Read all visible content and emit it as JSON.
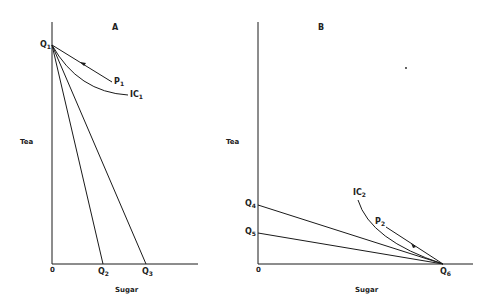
{
  "panels": [
    {
      "id": "A",
      "title": "A",
      "y_axis_label": "Tea",
      "x_axis_label": "Sugar",
      "origin_label": "0",
      "points": {
        "q1": {
          "name": "Q",
          "sub": "1"
        },
        "q2": {
          "name": "Q",
          "sub": "2"
        },
        "q3": {
          "name": "Q",
          "sub": "3"
        }
      },
      "curves": {
        "p1": {
          "name": "P",
          "sub": "1"
        },
        "ic1": {
          "name": "IC",
          "sub": "1"
        }
      }
    },
    {
      "id": "B",
      "title": "B",
      "y_axis_label": "Tea",
      "x_axis_label": "Sugar",
      "origin_label": "0",
      "points": {
        "q4": {
          "name": "Q",
          "sub": "4"
        },
        "q5": {
          "name": "Q",
          "sub": "5"
        },
        "q6": {
          "name": "Q",
          "sub": "6"
        }
      },
      "curves": {
        "p2": {
          "name": "P",
          "sub": "2"
        },
        "ic2": {
          "name": "IC",
          "sub": "2"
        }
      }
    }
  ],
  "colors": {
    "line": "#1a1a1a",
    "background": "#ffffff"
  }
}
